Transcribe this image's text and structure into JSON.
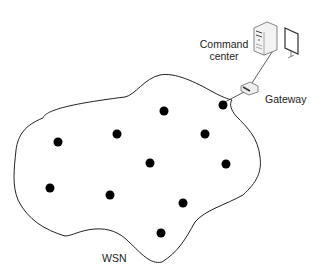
{
  "labels": {
    "command_center_line1": "Command",
    "command_center_line2": "center",
    "gateway": "Gateway",
    "wsn": "WSN"
  },
  "colors": {
    "stroke": "#222222",
    "node": "#000000",
    "background": "#ffffff"
  },
  "nodes": [
    {
      "x": 58,
      "y": 142
    },
    {
      "x": 117,
      "y": 134
    },
    {
      "x": 164,
      "y": 111
    },
    {
      "x": 223,
      "y": 105
    },
    {
      "x": 205,
      "y": 134
    },
    {
      "x": 150,
      "y": 163
    },
    {
      "x": 226,
      "y": 164
    },
    {
      "x": 50,
      "y": 188
    },
    {
      "x": 110,
      "y": 195
    },
    {
      "x": 183,
      "y": 203
    },
    {
      "x": 161,
      "y": 233
    }
  ]
}
